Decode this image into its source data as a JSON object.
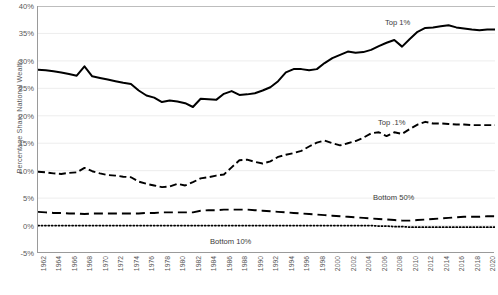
{
  "chart_data": {
    "type": "line",
    "title": "",
    "xlabel": "",
    "ylabel": "Percentage Share National Wealth",
    "xlim": [
      1962,
      2021
    ],
    "ylim": [
      -5,
      40
    ],
    "ytick_labels": [
      "40%",
      "35%",
      "30%",
      "25%",
      "20%",
      "15%",
      "10%",
      "5%",
      "0%",
      "-5%"
    ],
    "ytick_values": [
      40,
      35,
      30,
      25,
      20,
      15,
      10,
      5,
      0,
      -5
    ],
    "grid": "horizontal",
    "legend_position": "inline-annotations",
    "x": [
      1962,
      1963,
      1964,
      1965,
      1966,
      1967,
      1968,
      1969,
      1970,
      1971,
      1972,
      1973,
      1974,
      1975,
      1976,
      1977,
      1978,
      1979,
      1980,
      1981,
      1982,
      1983,
      1984,
      1985,
      1986,
      1987,
      1988,
      1989,
      1990,
      1991,
      1992,
      1993,
      1994,
      1995,
      1996,
      1997,
      1998,
      1999,
      2000,
      2001,
      2002,
      2003,
      2004,
      2005,
      2006,
      2007,
      2008,
      2009,
      2010,
      2011,
      2012,
      2013,
      2014,
      2015,
      2016,
      2017,
      2018,
      2019,
      2020,
      2021
    ],
    "xtick_labels": [
      "1962",
      "1964",
      "1966",
      "1968",
      "1970",
      "1972",
      "1974",
      "1976",
      "1978",
      "1980",
      "1982",
      "1984",
      "1986",
      "1988",
      "1990",
      "1992",
      "1994",
      "1996",
      "1998",
      "2000",
      "2002",
      "2004",
      "2006",
      "2008",
      "2010",
      "2012",
      "2014",
      "2016",
      "2018",
      "2020"
    ],
    "series": [
      {
        "name": "Top 1%",
        "label": "Top 1%",
        "style": "solid",
        "color": "#000000",
        "values": [
          28.4,
          28.3,
          28.1,
          27.9,
          27.6,
          27.3,
          29.0,
          27.2,
          26.9,
          26.6,
          26.3,
          26.0,
          25.8,
          24.6,
          23.7,
          23.3,
          22.5,
          22.8,
          22.6,
          22.3,
          21.6,
          23.1,
          23.0,
          22.9,
          24.0,
          24.5,
          23.8,
          23.9,
          24.1,
          24.6,
          25.2,
          26.3,
          27.9,
          28.5,
          28.5,
          28.3,
          28.5,
          29.6,
          30.5,
          31.1,
          31.7,
          31.5,
          31.6,
          32.0,
          32.7,
          33.3,
          33.8,
          32.6,
          34.0,
          35.3,
          36.0,
          36.1,
          36.3,
          36.5,
          36.1,
          35.9,
          35.7,
          35.6,
          35.7,
          35.7
        ]
      },
      {
        "name": "Top .1%",
        "label": "Top .1%",
        "style": "dashed",
        "color": "#000000",
        "values": [
          9.8,
          9.7,
          9.5,
          9.4,
          9.6,
          9.7,
          10.5,
          9.9,
          9.5,
          9.2,
          9.1,
          8.9,
          8.8,
          8.0,
          7.6,
          7.3,
          7.0,
          7.1,
          7.6,
          7.3,
          7.9,
          8.6,
          8.8,
          9.1,
          9.3,
          10.6,
          11.9,
          12.0,
          11.6,
          11.3,
          11.7,
          12.5,
          12.9,
          13.2,
          13.6,
          14.4,
          15.1,
          15.5,
          15.0,
          14.6,
          15.0,
          15.4,
          16.0,
          16.8,
          17.0,
          16.3,
          17.0,
          16.7,
          17.6,
          18.4,
          18.9,
          18.6,
          18.6,
          18.5,
          18.4,
          18.4,
          18.3,
          18.3,
          18.3,
          18.3
        ]
      },
      {
        "name": "Bottom 50%",
        "label": "Bottom 50%",
        "style": "long-dashed",
        "color": "#000000",
        "values": [
          2.5,
          2.4,
          2.3,
          2.3,
          2.2,
          2.2,
          2.1,
          2.2,
          2.2,
          2.2,
          2.2,
          2.2,
          2.2,
          2.2,
          2.3,
          2.3,
          2.4,
          2.4,
          2.4,
          2.4,
          2.4,
          2.7,
          2.8,
          2.8,
          2.9,
          2.9,
          2.9,
          2.9,
          2.8,
          2.7,
          2.6,
          2.5,
          2.4,
          2.3,
          2.2,
          2.1,
          2.0,
          1.9,
          1.8,
          1.7,
          1.6,
          1.5,
          1.4,
          1.3,
          1.2,
          1.1,
          1.0,
          0.9,
          0.9,
          1.0,
          1.1,
          1.2,
          1.3,
          1.4,
          1.5,
          1.6,
          1.6,
          1.6,
          1.7,
          1.7
        ]
      },
      {
        "name": "Bottom 10%",
        "label": "Bottom 10%",
        "style": "dotted",
        "color": "#000000",
        "values": [
          0.0,
          0.0,
          0.0,
          0.0,
          0.0,
          0.0,
          0.0,
          0.0,
          0.0,
          0.0,
          0.0,
          0.0,
          0.0,
          0.0,
          0.0,
          0.0,
          0.0,
          0.0,
          0.0,
          0.0,
          0.0,
          0.0,
          0.0,
          0.0,
          0.0,
          0.0,
          0.0,
          0.0,
          0.0,
          0.0,
          0.0,
          0.0,
          0.0,
          0.0,
          0.0,
          0.0,
          0.0,
          0.0,
          0.0,
          0.0,
          0.0,
          0.0,
          0.0,
          0.0,
          -0.1,
          -0.1,
          -0.2,
          -0.2,
          -0.3,
          -0.3,
          -0.3,
          -0.3,
          -0.3,
          -0.3,
          -0.3,
          -0.3,
          -0.3,
          -0.3,
          -0.3,
          -0.3
        ]
      }
    ]
  },
  "axis": {
    "ylabel": "Percentage Share National Wealth"
  },
  "caption": {
    "text": ""
  }
}
